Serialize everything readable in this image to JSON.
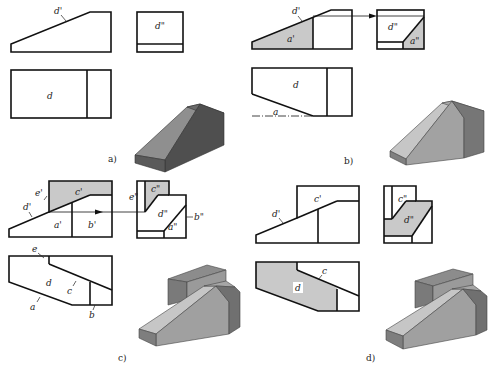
{
  "figure": {
    "panels": [
      {
        "id": "a",
        "caption": "a)",
        "labels": {
          "front": "d'",
          "side": "d\"",
          "top": "d"
        }
      },
      {
        "id": "b",
        "caption": "b)",
        "labels": {
          "front_face": "d'",
          "front_shaded": "a'",
          "side": "d\"",
          "side_shaded": "a\"",
          "top": "d",
          "top_line": "a"
        }
      },
      {
        "id": "c",
        "caption": "c)",
        "labels": {
          "front_e": "e'",
          "front_c": "c'",
          "front_d": "d'",
          "front_a": "a'",
          "front_b": "b'",
          "side_e": "e\"",
          "side_c": "c\"",
          "side_d": "d\"",
          "side_a": "a\"",
          "side_b": "b\"",
          "top_e": "e",
          "top_d": "d",
          "top_c": "c",
          "top_a": "a",
          "top_b": "b"
        }
      },
      {
        "id": "d",
        "caption": "d)",
        "labels": {
          "front_c": "c'",
          "front_d": "d'",
          "side_c": "c\"",
          "side_d": "d\"",
          "top_c": "c",
          "top_d": "d"
        }
      }
    ],
    "colors": {
      "line": "#111111",
      "shade": "#c9c9c9",
      "solid_top": "#a9a9a9",
      "solid_front": "#8a8a8a",
      "solid_side": "#6e6e6e",
      "solid_dark_a": "#555555"
    }
  }
}
